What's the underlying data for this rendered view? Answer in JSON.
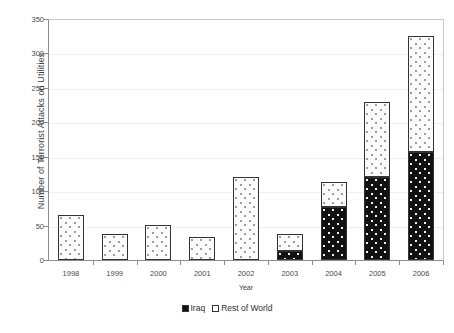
{
  "chart_data": {
    "type": "bar",
    "subtype": "stacked-column",
    "title": "",
    "xlabel": "Year",
    "ylabel": "Number of Terrorist Attacks on Utilities",
    "categories": [
      "1998",
      "1999",
      "2000",
      "2001",
      "2002",
      "2003",
      "2004",
      "2005",
      "2006"
    ],
    "series": [
      {
        "name": "Iraq",
        "values": [
          0,
          0,
          0,
          0,
          0,
          13,
          77,
          120,
          157
        ]
      },
      {
        "name": "Rest of World",
        "values": [
          66,
          38,
          51,
          33,
          120,
          25,
          36,
          110,
          169
        ]
      }
    ],
    "totals": [
      66,
      38,
      51,
      33,
      120,
      38,
      113,
      230,
      326
    ],
    "ylim": [
      0,
      350
    ],
    "yticks": [
      0,
      50,
      100,
      150,
      200,
      250,
      300,
      350
    ],
    "ytick_labels": [
      "0",
      "50",
      "100",
      "150",
      "200",
      "250",
      "300",
      "350"
    ],
    "grid": true,
    "legend_position": "bottom",
    "legend": [
      "Iraq",
      "Rest of World"
    ],
    "colors": {
      "iraq": "#111111",
      "rest_of_world": "#fbfbfb",
      "axis": "#8d8d8d",
      "gridline": "#f0f0f0",
      "border": "#333333"
    }
  }
}
